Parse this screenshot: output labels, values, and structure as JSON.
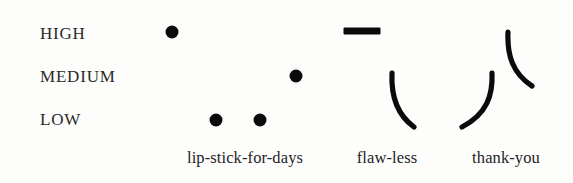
{
  "chart_data": {
    "type": "scatter",
    "title": "",
    "subtitle": "",
    "xlabel": "",
    "ylabel": "",
    "grid": false,
    "legend": "none",
    "categories": [
      "lip-stick-for-days",
      "flaw-less",
      "thank-you"
    ],
    "levels": [
      "HIGH",
      "MEDIUM",
      "LOW"
    ],
    "ylim": [
      "LOW",
      "HIGH"
    ],
    "annotations": [],
    "series": [
      {
        "name": "lip-stick-for-days",
        "category": "lip-stick-for-days",
        "marks": [
          {
            "glyph": "dot",
            "level": "HIGH",
            "x": 172,
            "y": 32,
            "size": 13
          },
          {
            "glyph": "dot",
            "level": "LOW",
            "x": 216,
            "y": 120,
            "size": 13
          },
          {
            "glyph": "dot",
            "level": "LOW",
            "x": 260,
            "y": 120,
            "size": 13
          },
          {
            "glyph": "dot",
            "level": "MEDIUM",
            "x": 296,
            "y": 76,
            "size": 13
          }
        ]
      },
      {
        "name": "flaw-less",
        "category": "flaw-less",
        "marks": [
          {
            "glyph": "dash",
            "level": "HIGH",
            "x": 362,
            "y": 31,
            "size": 37
          },
          {
            "glyph": "curve",
            "level": "MEDIUM-to-LOW",
            "x": 392,
            "y": 73,
            "path": "M 392 73 C 391 95, 396 114, 414 127"
          }
        ]
      },
      {
        "name": "thank-you",
        "category": "thank-you",
        "marks": [
          {
            "glyph": "curve",
            "level": "MEDIUM-to-LOW",
            "x": 492,
            "y": 73,
            "path": "M 492 73 C 493 95, 487 114, 462 127"
          },
          {
            "glyph": "curve",
            "level": "HIGH-to-MEDIUM",
            "x": 508,
            "y": 32,
            "path": "M 508 32 C 507 54, 512 73, 532 86"
          }
        ]
      }
    ],
    "colors": {
      "mark": "#0b0b0b",
      "label": "#242424",
      "background": "#fdfdfc"
    }
  },
  "axes": {
    "y": {
      "ticks": [
        {
          "label": "HIGH",
          "key": "high",
          "top": 33
        },
        {
          "label": "MEDIUM",
          "key": "medium",
          "top": 76
        },
        {
          "label": "LOW",
          "key": "low",
          "top": 119
        }
      ]
    },
    "x": {
      "ticks": [
        {
          "label": "lip-stick-for-days",
          "key": "cat0",
          "left": 245
        },
        {
          "label": "flaw-less",
          "key": "cat1",
          "left": 387
        },
        {
          "label": "thank-you",
          "key": "cat2",
          "left": 506
        }
      ]
    }
  }
}
